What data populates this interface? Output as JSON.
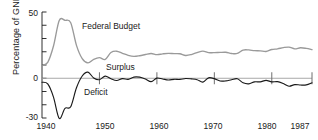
{
  "chart_data": {
    "type": "line",
    "title": "",
    "subtitle": "",
    "xlabel": "",
    "ylabel": "Percentage of GNP",
    "xlim": [
      1940,
      1987
    ],
    "ylim": [
      -30,
      50
    ],
    "grid": false,
    "legend_position": "inline-annotations",
    "x_ticks": [
      1940,
      1950,
      1960,
      1970,
      1980,
      1987
    ],
    "x_tick_labels": [
      "1940",
      "1950",
      "1960",
      "1970",
      "1980",
      "1987"
    ],
    "y_ticks": [
      -30,
      -20,
      -10,
      0,
      10,
      20,
      30,
      40,
      50
    ],
    "y_tick_labels": [
      "-30",
      "",
      "",
      "0",
      "",
      "",
      "",
      "",
      "50"
    ],
    "annotations": [
      {
        "text": "Federal Budget",
        "x": 1948,
        "y": 36
      },
      {
        "text": "Surplus",
        "x": 1953,
        "y": 7
      },
      {
        "text": "Deficit",
        "x": 1949,
        "y": -9
      }
    ],
    "series": [
      {
        "name": "Federal Budget",
        "color": "#9a9a9a",
        "x": [
          1940,
          1941,
          1942,
          1943,
          1944,
          1945,
          1946,
          1947,
          1948,
          1949,
          1950,
          1951,
          1952,
          1953,
          1954,
          1955,
          1956,
          1957,
          1958,
          1959,
          1960,
          1961,
          1962,
          1963,
          1964,
          1965,
          1966,
          1967,
          1968,
          1969,
          1970,
          1971,
          1972,
          1973,
          1974,
          1975,
          1976,
          1977,
          1978,
          1979,
          1980,
          1981,
          1982,
          1983,
          1984,
          1985,
          1986,
          1987
        ],
        "values": [
          9.8,
          12.0,
          24.3,
          43.6,
          43.7,
          41.9,
          24.8,
          14.8,
          11.6,
          14.3,
          15.6,
          14.2,
          19.4,
          20.4,
          18.8,
          17.3,
          16.5,
          17.0,
          17.9,
          18.7,
          17.8,
          18.4,
          18.8,
          18.6,
          18.5,
          17.2,
          17.9,
          19.4,
          20.5,
          19.4,
          19.3,
          19.5,
          19.6,
          18.7,
          18.7,
          21.3,
          21.4,
          20.8,
          20.7,
          20.2,
          21.7,
          22.2,
          23.1,
          23.5,
          22.2,
          23.0,
          22.5,
          21.6
        ]
      },
      {
        "name": "Surplus or Deficit",
        "color": "#1a1a1a",
        "x": [
          1940,
          1941,
          1942,
          1943,
          1944,
          1945,
          1946,
          1947,
          1948,
          1949,
          1950,
          1951,
          1952,
          1953,
          1954,
          1955,
          1956,
          1957,
          1958,
          1959,
          1960,
          1961,
          1962,
          1963,
          1964,
          1965,
          1966,
          1967,
          1968,
          1969,
          1970,
          1971,
          1972,
          1973,
          1974,
          1975,
          1976,
          1977,
          1978,
          1979,
          1980,
          1981,
          1982,
          1983,
          1984,
          1985,
          1986,
          1987
        ],
        "values": [
          -3.0,
          -4.3,
          -14.2,
          -30.3,
          -22.7,
          -21.5,
          -7.2,
          1.7,
          4.6,
          0.2,
          -1.1,
          1.6,
          -0.4,
          -1.7,
          -0.3,
          -0.8,
          0.9,
          0.8,
          -0.6,
          -2.6,
          0.1,
          -0.6,
          -1.3,
          -0.8,
          -0.9,
          -0.2,
          -0.5,
          -1.1,
          -2.9,
          0.3,
          -0.3,
          -2.1,
          -2.0,
          -1.1,
          -0.4,
          -3.4,
          -4.2,
          -2.7,
          -2.7,
          -1.6,
          -2.7,
          -2.6,
          -4.0,
          -6.0,
          -4.8,
          -5.1,
          -5.0,
          -3.4
        ]
      }
    ]
  },
  "axis": {
    "y_title": "Percentage of GNP",
    "y_top_label": "50",
    "y_zero_label": "0",
    "y_bottom_label": "-30",
    "x_labels": [
      "1940",
      "1950",
      "1960",
      "1970",
      "1980",
      "1987"
    ]
  },
  "labels": {
    "federal_budget": "Federal Budget",
    "surplus": "Surplus",
    "deficit": "Deficit"
  }
}
